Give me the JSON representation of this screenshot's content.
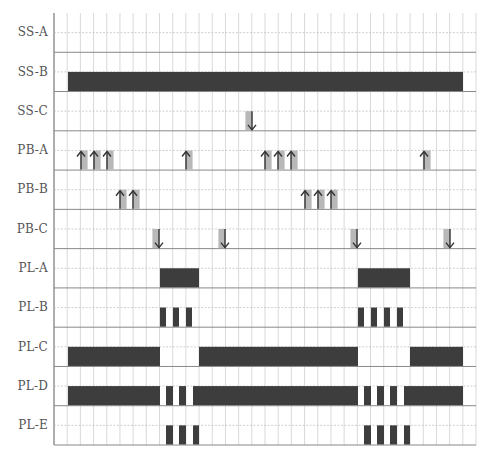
{
  "diagram": {
    "type": "timing-diagram",
    "grid": {
      "x0": 54,
      "x1": 476,
      "y0": 13,
      "y1": 445,
      "columns": 32,
      "rows": 11
    },
    "colors": {
      "bar": "#3d3d3d",
      "arrow": "#333333",
      "arrow_shade": "#b8b8b8",
      "grid": "#cfcfcf",
      "row_line": "#888888",
      "label": "#555555"
    },
    "signals": [
      {
        "name": "SS-A",
        "bars": [],
        "arrows_up": [],
        "arrows_down": []
      },
      {
        "name": "SS-B",
        "bars": [
          [
            68,
            463
          ]
        ],
        "arrows_up": [],
        "arrows_down": []
      },
      {
        "name": "SS-C",
        "bars": [],
        "arrows_up": [],
        "arrows_down": [
          252
        ]
      },
      {
        "name": "PB-A",
        "bars": [],
        "arrows_up": [
          81,
          94,
          107,
          186,
          265,
          278,
          291,
          424
        ],
        "arrows_down": []
      },
      {
        "name": "PB-B",
        "bars": [],
        "arrows_up": [
          120,
          133,
          305,
          318,
          331
        ],
        "arrows_down": []
      },
      {
        "name": "PB-C",
        "bars": [],
        "arrows_up": [],
        "arrows_down": [
          159,
          225,
          357,
          450
        ]
      },
      {
        "name": "PL-A",
        "bars": [
          [
            160,
            199
          ],
          [
            358,
            410
          ]
        ],
        "arrows_up": [],
        "arrows_down": []
      },
      {
        "name": "PL-B",
        "bars": [
          [
            160,
            166
          ],
          [
            173,
            179
          ],
          [
            186,
            192
          ],
          [
            358,
            364
          ],
          [
            371,
            377
          ],
          [
            384,
            390
          ],
          [
            397,
            403
          ]
        ],
        "arrows_up": [],
        "arrows_down": []
      },
      {
        "name": "PL-C",
        "bars": [
          [
            68,
            160
          ],
          [
            199,
            358
          ],
          [
            410,
            463
          ]
        ],
        "arrows_up": [],
        "arrows_down": []
      },
      {
        "name": "PL-D",
        "bars": [
          [
            68,
            160
          ],
          [
            166,
            173
          ],
          [
            179,
            186
          ],
          [
            193,
            358
          ],
          [
            364,
            371
          ],
          [
            377,
            384
          ],
          [
            390,
            397
          ],
          [
            404,
            463
          ]
        ],
        "arrows_up": [],
        "arrows_down": []
      },
      {
        "name": "PL-E",
        "bars": [
          [
            166,
            173
          ],
          [
            179,
            186
          ],
          [
            193,
            199
          ],
          [
            364,
            371
          ],
          [
            377,
            384
          ],
          [
            390,
            397
          ],
          [
            404,
            410
          ]
        ],
        "arrows_up": [],
        "arrows_down": []
      }
    ]
  },
  "labels": {
    "ss_a": "SS-A",
    "ss_b": "SS-B",
    "ss_c": "SS-C",
    "pb_a": "PB-A",
    "pb_b": "PB-B",
    "pb_c": "PB-C",
    "pl_a": "PL-A",
    "pl_b": "PL-B",
    "pl_c": "PL-C",
    "pl_d": "PL-D",
    "pl_e": "PL-E"
  }
}
